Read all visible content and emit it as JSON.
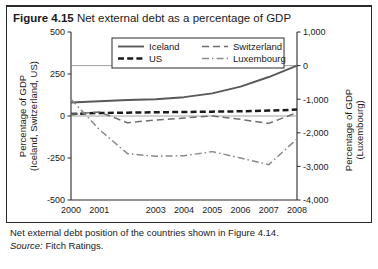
{
  "figure": {
    "number_label": "Figure 4.15",
    "title": "Net external debt as a percentage of GDP",
    "caption": "Net external debt position of the countries shown in Figure 4.14.",
    "source_label": "Source:",
    "source_value": "Fitch Ratings."
  },
  "colors": {
    "iceland": "#595959",
    "us": "#1a1a1a",
    "switzerland": "#6e6e6e",
    "luxembourg": "#8a8a8a",
    "axis": "#2a2a2a",
    "grid": "#8a8a8a",
    "background": "#ffffff"
  },
  "chart_data": {
    "type": "line",
    "title": "Net external debt as a percentage of GDP",
    "xlabel": "",
    "ylabel": "Percentage of GDP (Iceland, Switzerland, US)",
    "y2label": "Percentage of GDP (Luxembourg)",
    "x": [
      2000,
      2001,
      2002,
      2003,
      2004,
      2005,
      2006,
      2007,
      2008
    ],
    "xticklabels": [
      "2000",
      "2001",
      "2003",
      "2004",
      "2005",
      "2006",
      "2007",
      "2008"
    ],
    "xticklabel_positions": [
      2000,
      2001,
      2003,
      2004,
      2005,
      2006,
      2007,
      2008
    ],
    "ylim": [
      -500,
      500
    ],
    "yticks": [
      500,
      250,
      0,
      -250,
      -500
    ],
    "yticklabels": [
      "500",
      "250",
      "0",
      "-250",
      "-500"
    ],
    "y2lim": [
      -4000,
      1000
    ],
    "y2ticks": [
      1000,
      0,
      -1000,
      -2000,
      -3000,
      -4000
    ],
    "y2ticklabels": [
      "1,000",
      "0",
      "-1,000",
      "-2,000",
      "-3,000",
      "-4,000"
    ],
    "gridlines_left_axis": [
      300,
      0
    ],
    "grid": true,
    "legend_position": "top-center",
    "series": [
      {
        "name": "Iceland",
        "axis": "left",
        "style": "solid",
        "values": [
          80,
          88,
          95,
          100,
          112,
          135,
          175,
          232,
          300
        ]
      },
      {
        "name": "US",
        "axis": "left",
        "style": "dashed-thick",
        "values": [
          12,
          18,
          20,
          22,
          24,
          26,
          28,
          32,
          38
        ]
      },
      {
        "name": "Switzerland",
        "axis": "right",
        "style": "dashed",
        "values": [
          -1450,
          -1380,
          -1700,
          -1620,
          -1560,
          -1500,
          -1600,
          -1720,
          -1400
        ]
      },
      {
        "name": "Luxembourg",
        "axis": "right",
        "style": "dash-dot",
        "values": [
          -1000,
          -1900,
          -2620,
          -2700,
          -2680,
          -2560,
          -2750,
          -2950,
          -2180
        ]
      }
    ]
  },
  "legend": {
    "items": [
      {
        "label": "Iceland",
        "style": "solid"
      },
      {
        "label": "Switzerland",
        "style": "dashed"
      },
      {
        "label": "US",
        "style": "dashed-thick"
      },
      {
        "label": "Luxembourg",
        "style": "dash-dot"
      }
    ]
  },
  "axes": {
    "left_label_line1": "Percentage of GDP",
    "left_label_line2": "(Iceland, Switzerland, US)",
    "right_label_line1": "Percentage of GDP",
    "right_label_line2": "(Luxembourg)"
  }
}
